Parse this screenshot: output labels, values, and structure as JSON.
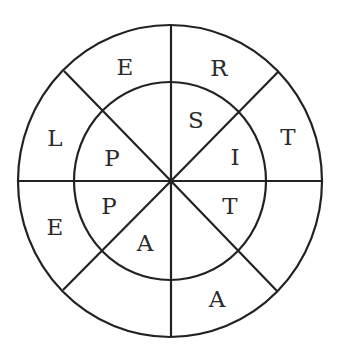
{
  "diagram": {
    "type": "circular-word-puzzle",
    "rings": 2,
    "sectors": 8,
    "line_color": "#222222",
    "text_color": "#2a2a2a",
    "outer_ring_letters": [
      {
        "position": "top-left",
        "letter": "E"
      },
      {
        "position": "top-right",
        "letter": "R"
      },
      {
        "position": "right-upper",
        "letter": "T"
      },
      {
        "position": "right-lower",
        "letter": ""
      },
      {
        "position": "bottom-right",
        "letter": "A"
      },
      {
        "position": "bottom-left",
        "letter": ""
      },
      {
        "position": "left-lower",
        "letter": "E"
      },
      {
        "position": "left-upper",
        "letter": "L"
      }
    ],
    "inner_ring_letters": [
      {
        "position": "top-left",
        "letter": ""
      },
      {
        "position": "top-right",
        "letter": "S"
      },
      {
        "position": "right-upper",
        "letter": "I"
      },
      {
        "position": "right-lower",
        "letter": "T"
      },
      {
        "position": "bottom-right",
        "letter": ""
      },
      {
        "position": "bottom-left",
        "letter": "A"
      },
      {
        "position": "left-lower",
        "letter": "P"
      },
      {
        "position": "left-upper",
        "letter": "P"
      }
    ]
  }
}
